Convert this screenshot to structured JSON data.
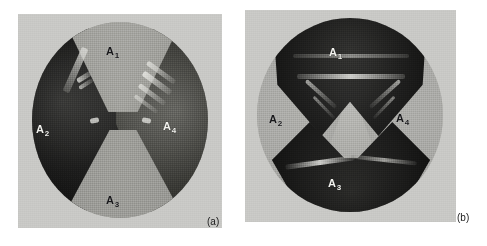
{
  "figure": {
    "type": "photograph-pair",
    "panels": [
      {
        "id": "a",
        "caption": "(a)",
        "background_tone": "light-grey",
        "regions": [
          {
            "id": "a1",
            "letter": "A",
            "subscript": "1",
            "position": "top",
            "tone": "light"
          },
          {
            "id": "a2",
            "letter": "A",
            "subscript": "2",
            "position": "left",
            "tone": "dark"
          },
          {
            "id": "a3",
            "letter": "A",
            "subscript": "3",
            "position": "bottom",
            "tone": "light"
          },
          {
            "id": "a4",
            "letter": "A",
            "subscript": "4",
            "position": "right",
            "tone": "dark"
          }
        ]
      },
      {
        "id": "b",
        "caption": "(b)",
        "background_tone": "light-grey",
        "regions": [
          {
            "id": "a1",
            "letter": "A",
            "subscript": "1",
            "position": "top",
            "tone": "dark"
          },
          {
            "id": "a2",
            "letter": "A",
            "subscript": "2",
            "position": "left",
            "tone": "light"
          },
          {
            "id": "a3",
            "letter": "A",
            "subscript": "3",
            "position": "bottom",
            "tone": "dark"
          },
          {
            "id": "a4",
            "letter": "A",
            "subscript": "4",
            "position": "right",
            "tone": "light"
          }
        ]
      }
    ],
    "colors": {
      "page_background": "#ffffff",
      "plate_background": "#c9c9c6",
      "disc_a": "#9a9a96",
      "disc_b": "#b5b5b1",
      "dark_domain": "#1b1b1a",
      "light_domain": "#b6b6b1",
      "label_dark": "#17171a",
      "label_light": "#f2f2ee"
    }
  }
}
